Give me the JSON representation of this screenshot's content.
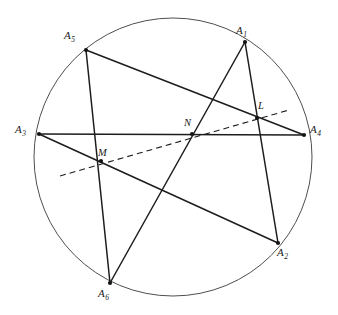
{
  "figure": {
    "stroke_color": "#1d1d1d",
    "circle_color": "#3a3a3a",
    "background": "#ffffff",
    "width": 338,
    "height": 315,
    "circle": {
      "cx": 173,
      "cy": 157,
      "r": 139,
      "stroke_width": 0.9
    },
    "vertices": [
      {
        "id": "A1",
        "letter": "A",
        "subscript": "1",
        "x": 245,
        "y": 42,
        "label_x": 236,
        "label_y": 25
      },
      {
        "id": "A2",
        "letter": "A",
        "subscript": "2",
        "x": 278,
        "y": 243,
        "label_x": 277,
        "label_y": 247
      },
      {
        "id": "A3",
        "letter": "A",
        "subscript": "3",
        "x": 39,
        "y": 134,
        "label_x": 15,
        "label_y": 124
      },
      {
        "id": "A4",
        "letter": "A",
        "subscript": "4",
        "x": 304,
        "y": 135,
        "label_x": 310,
        "label_y": 124
      },
      {
        "id": "A5",
        "letter": "A",
        "subscript": "5",
        "x": 86,
        "y": 50,
        "label_x": 64,
        "label_y": 30
      },
      {
        "id": "A6",
        "letter": "A",
        "subscript": "6",
        "x": 110,
        "y": 283,
        "label_x": 98,
        "label_y": 288
      }
    ],
    "intersections": [
      {
        "id": "L",
        "label": "L",
        "x": 257,
        "y": 118,
        "label_x": 258,
        "label_y": 101
      },
      {
        "id": "M",
        "label": "M",
        "x": 101,
        "y": 161,
        "label_x": 98,
        "label_y": 148
      },
      {
        "id": "N",
        "label": "N",
        "x": 192,
        "y": 134,
        "label_x": 184,
        "label_y": 118
      }
    ],
    "chords": [
      {
        "id": "A5-A4",
        "from": "A5",
        "to": "A4",
        "x1": 86,
        "y1": 50,
        "x2": 304,
        "y2": 135
      },
      {
        "id": "A5-A6",
        "from": "A5",
        "to": "A6",
        "x1": 86,
        "y1": 50,
        "x2": 110,
        "y2": 283
      },
      {
        "id": "A1-A6",
        "from": "A1",
        "to": "A6",
        "x1": 245,
        "y1": 42,
        "x2": 110,
        "y2": 283
      },
      {
        "id": "A1-A2",
        "from": "A1",
        "to": "A2",
        "x1": 245,
        "y1": 42,
        "x2": 278,
        "y2": 243
      },
      {
        "id": "A3-A4",
        "from": "A3",
        "to": "A4",
        "x1": 39,
        "y1": 134,
        "x2": 304,
        "y2": 135
      },
      {
        "id": "A3-A2",
        "from": "A3",
        "to": "A2",
        "x1": 39,
        "y1": 134,
        "x2": 278,
        "y2": 243
      }
    ],
    "pascal_line": {
      "id": "pascal-line",
      "style": "dashed",
      "dash_pattern": "6 4",
      "x1": 60,
      "y1": 176,
      "x2": 289,
      "y2": 110,
      "passes_through": [
        "M",
        "N",
        "L"
      ]
    },
    "vertex_dot_radius": 2.1
  }
}
